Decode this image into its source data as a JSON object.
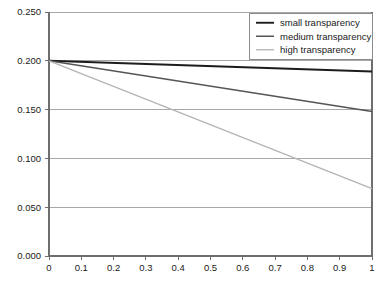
{
  "chart_data": {
    "type": "line",
    "title": "",
    "xlabel": "",
    "ylabel": "",
    "xlim": [
      0,
      1
    ],
    "ylim": [
      0,
      0.25
    ],
    "grid": true,
    "grid_axis": "y",
    "legend_position": "top-right",
    "x": [
      0,
      1
    ],
    "xticks": [
      0,
      0.1,
      0.2,
      0.3,
      0.4,
      0.5,
      0.6,
      0.7,
      0.8,
      0.9,
      1
    ],
    "xtick_labels": [
      "0",
      "0.1",
      "0.2",
      "0.3",
      "0.4",
      "0.5",
      "0.6",
      "0.7",
      "0.8",
      "0.9",
      "1"
    ],
    "yticks": [
      0,
      0.05,
      0.1,
      0.15,
      0.2,
      0.25
    ],
    "ytick_labels": [
      "0.000",
      "0.050",
      "0.100",
      "0.150",
      "0.200",
      "0.250"
    ],
    "series": [
      {
        "name": "small transparency",
        "color": "#1c1c1c",
        "width": 1.9,
        "values": [
          0.2,
          0.189
        ]
      },
      {
        "name": "medium transparency",
        "color": "#555555",
        "width": 1.5,
        "values": [
          0.2,
          0.148
        ]
      },
      {
        "name": "high transparency",
        "color": "#b4b4b4",
        "width": 1.3,
        "values": [
          0.2,
          0.069
        ]
      }
    ]
  },
  "legend": {
    "entries": [
      {
        "label": "small transparency"
      },
      {
        "label": "medium transparency"
      },
      {
        "label": "high transparency"
      }
    ]
  },
  "colors": {
    "background": "#ffffff",
    "plot_background": "#ffffff",
    "grid": "#a8a8a8",
    "axis": "#6e6e6e",
    "legend_border": "#8c8c8c",
    "text": "#1a1a1a"
  }
}
